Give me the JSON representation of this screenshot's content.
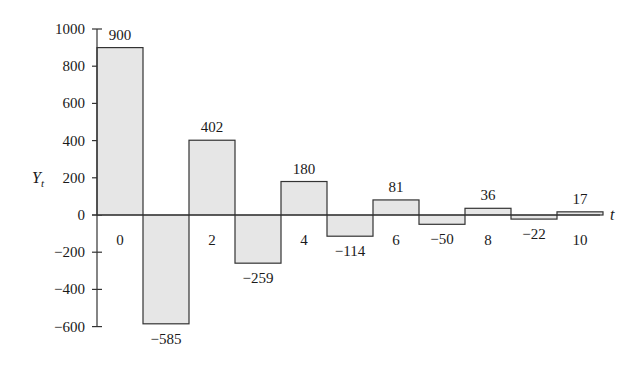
{
  "chart_data": {
    "type": "bar",
    "title": "",
    "xlabel": "t",
    "ylabel": "Y",
    "ylabel_subscript": "t",
    "x": [
      0,
      1,
      2,
      3,
      4,
      5,
      6,
      7,
      8,
      9,
      10
    ],
    "values": [
      900,
      -585,
      402,
      -259,
      180,
      -114,
      81,
      -50,
      36,
      -22,
      17
    ],
    "data_labels": [
      "900",
      "−585",
      "402",
      "−259",
      "180",
      "−114",
      "81",
      "−50",
      "36",
      "−22",
      "17"
    ],
    "x_tick_labels": [
      {
        "t": 0,
        "label": "0"
      },
      {
        "t": 2,
        "label": "2"
      },
      {
        "t": 4,
        "label": "4"
      },
      {
        "t": 6,
        "label": "6"
      },
      {
        "t": 8,
        "label": "8"
      },
      {
        "t": 10,
        "label": "10"
      }
    ],
    "y_ticks": [
      1000,
      800,
      600,
      400,
      200,
      0,
      -200,
      -400,
      -600
    ],
    "y_tick_labels": [
      "1000",
      "800",
      "600",
      "400",
      "200",
      "0",
      "−200",
      "−400",
      "−600"
    ],
    "ylim": [
      -600,
      1000
    ],
    "grid": false,
    "legend": null,
    "bar_fill": "#e6e6e6",
    "bar_stroke": "#333333"
  }
}
